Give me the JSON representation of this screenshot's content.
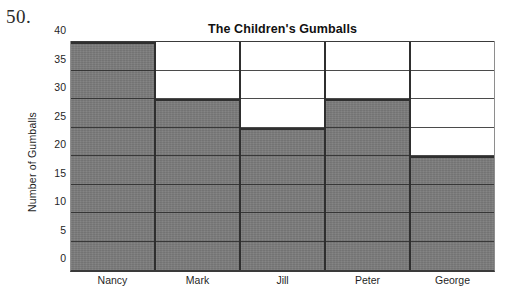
{
  "question_number": "50.",
  "chart_data": {
    "type": "bar",
    "title": "The Children's Gumballs",
    "xlabel": "",
    "ylabel": "Number of Gumballs",
    "categories": [
      "Nancy",
      "Mark",
      "Jill",
      "Peter",
      "George"
    ],
    "values": [
      40,
      30,
      25,
      30,
      20
    ],
    "ylim": [
      0,
      40
    ],
    "ytick_step": 5,
    "yticks": [
      0,
      5,
      10,
      15,
      20,
      25,
      30,
      35,
      40
    ],
    "ytick_labels": [
      "0",
      "5",
      "10",
      "15",
      "20",
      "25",
      "30",
      "35",
      "40"
    ],
    "grid": true,
    "legend": false,
    "bar_color": "#7a7a7a",
    "bar_edge_color": "#2f2f2f",
    "grid_color": "#2b2b2b",
    "plot_background": "#ffffff"
  }
}
